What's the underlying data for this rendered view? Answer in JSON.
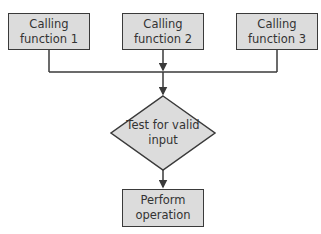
{
  "diagram": {
    "type": "flowchart",
    "nodes": [
      {
        "id": "calling1",
        "shape": "rectangle",
        "label": "Calling function 1",
        "lines": [
          "Calling",
          "function 1"
        ]
      },
      {
        "id": "calling2",
        "shape": "rectangle",
        "label": "Calling function 2",
        "lines": [
          "Calling",
          "function 2"
        ]
      },
      {
        "id": "calling3",
        "shape": "rectangle",
        "label": "Calling function 3",
        "lines": [
          "Calling",
          "function 3"
        ]
      },
      {
        "id": "test",
        "shape": "diamond",
        "label": "Test for valid input",
        "lines": [
          "Test for valid",
          "input"
        ]
      },
      {
        "id": "perform",
        "shape": "rectangle",
        "label": "Perform operation",
        "lines": [
          "Perform",
          "operation"
        ]
      }
    ],
    "edges": [
      {
        "from": "calling1",
        "to": "test"
      },
      {
        "from": "calling2",
        "to": "test"
      },
      {
        "from": "calling3",
        "to": "test"
      },
      {
        "from": "test",
        "to": "perform"
      }
    ],
    "colors": {
      "box_fill": "#dcdcdc",
      "stroke": "#3a3a3a",
      "text": "#333333"
    }
  }
}
